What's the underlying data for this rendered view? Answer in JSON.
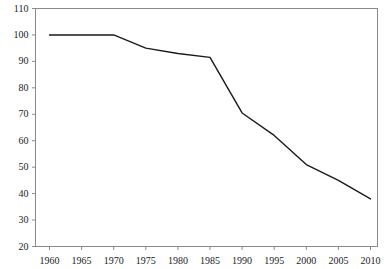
{
  "chart_data": {
    "type": "line",
    "title": "",
    "subtitle": "",
    "xlabel": "",
    "ylabel": "",
    "x": [
      1960,
      1965,
      1970,
      1975,
      1980,
      1985,
      1990,
      1995,
      2000,
      2005,
      2010
    ],
    "values": [
      100,
      100,
      100,
      95,
      93,
      91.5,
      70.5,
      62,
      51,
      45,
      38
    ],
    "series": [
      {
        "name": "index",
        "values": [
          100,
          100,
          100,
          95,
          93,
          91.5,
          70.5,
          62,
          51,
          45,
          38
        ]
      }
    ],
    "xtick_labels": [
      "1960",
      "1965",
      "1970",
      "1975",
      "1980",
      "1985",
      "1990",
      "1995",
      "2000",
      "2005",
      "2010"
    ],
    "ytick_labels": [
      "20",
      "30",
      "40",
      "50",
      "60",
      "70",
      "80",
      "90",
      "100",
      "110"
    ],
    "yticks": [
      20,
      30,
      40,
      50,
      60,
      70,
      80,
      90,
      100,
      110
    ],
    "xlim": [
      1960,
      2010
    ],
    "ylim": [
      20,
      110
    ],
    "grid": false,
    "legend": false,
    "legend_position": "none",
    "annotations": [],
    "line_color": "#1a1a1a",
    "frame_color": "#8a8a8a",
    "background_color": "#ffffff"
  }
}
